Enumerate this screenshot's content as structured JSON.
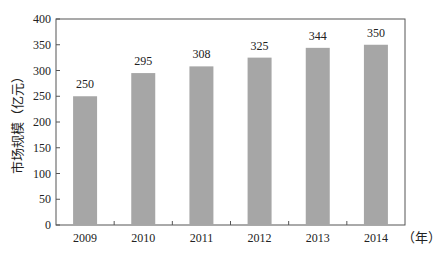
{
  "chart_data": {
    "type": "bar",
    "title": "",
    "xlabel": "（年）",
    "ylabel": "市场规模（亿元）",
    "categories": [
      "2009",
      "2010",
      "2011",
      "2012",
      "2013",
      "2014"
    ],
    "values": [
      250,
      295,
      308,
      325,
      344,
      350
    ],
    "data_labels": [
      "250",
      "295",
      "308",
      "325",
      "344",
      "350"
    ],
    "ylim": [
      0,
      400
    ],
    "yticks": [
      0,
      50,
      100,
      150,
      200,
      250,
      300,
      350,
      400
    ],
    "grid": false,
    "legend": null,
    "bar_color": "#a6a6a6"
  }
}
